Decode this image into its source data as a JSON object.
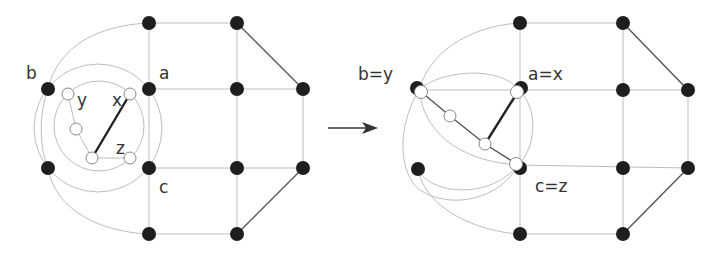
{
  "labels": {
    "left": {
      "b": "b",
      "a": "a",
      "c": "c",
      "y": "y",
      "x": "x",
      "z": "z"
    },
    "right": {
      "by": "b=y",
      "ax": "a=x",
      "cz": "c=z"
    }
  },
  "colors": {
    "black_node": "#1e1e1e",
    "white_node": "#ffffff",
    "edge": "#bdbdbd",
    "bold_edge": "#222222"
  },
  "arrow": {
    "direction": "right"
  }
}
